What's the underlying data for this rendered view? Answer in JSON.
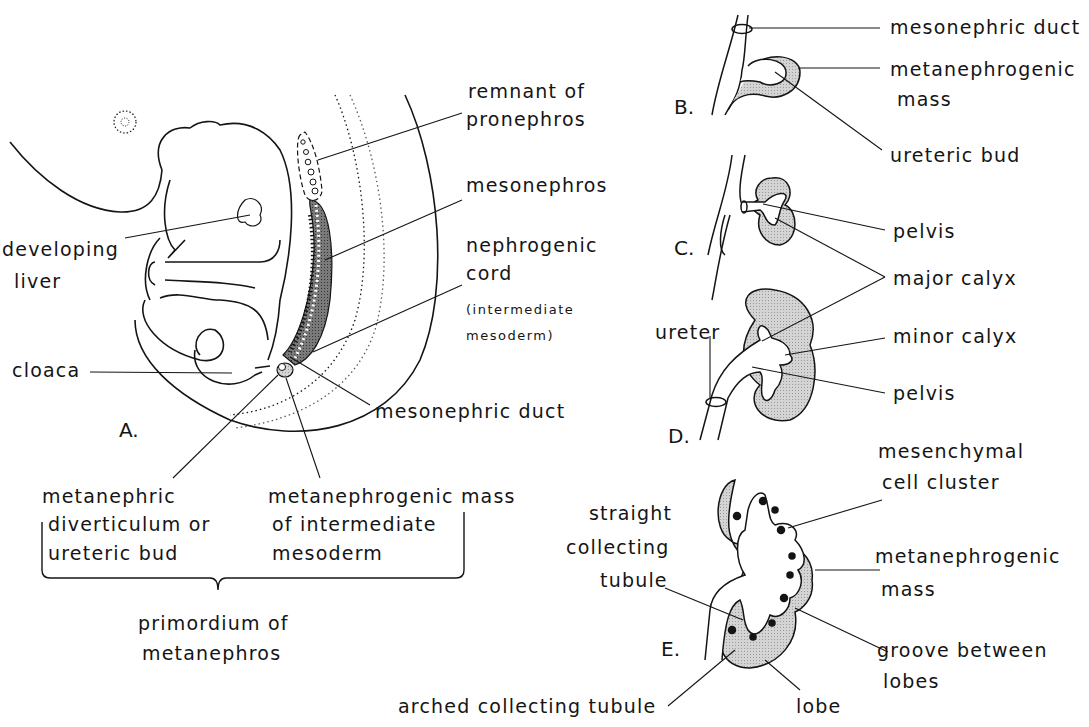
{
  "figure": {
    "colors": {
      "ink": "#141414",
      "stipple": "#c8c8c8",
      "dark_stipple": "#6a6a6a",
      "background": "#ffffff"
    },
    "panels": {
      "A": {
        "letter": "A.",
        "labels": {
          "remnant_pronephros_1": "remnant of",
          "remnant_pronephros_2": "pronephros",
          "mesonephros": "mesonephros",
          "nephrogenic_cord_1": "nephrogenic",
          "nephrogenic_cord_2": "cord",
          "nephrogenic_cord_3": "(intermediate",
          "nephrogenic_cord_4": "mesoderm)",
          "developing_liver_1": "developing",
          "developing_liver_2": "liver",
          "cloaca": "cloaca",
          "mesonephric_duct": "mesonephric duct",
          "metanephric_diverticulum_1": "metanephric",
          "metanephric_diverticulum_2": "diverticulum or",
          "metanephric_diverticulum_3": "ureteric bud",
          "metanephrogenic_mass_1": "metanephrogenic  mass",
          "metanephrogenic_mass_2": "of intermediate",
          "metanephrogenic_mass_3": "mesoderm",
          "primordium_1": "primordium of",
          "primordium_2": "metanephros"
        }
      },
      "B": {
        "letter": "B.",
        "labels": {
          "mesonephric_duct": "mesonephric duct",
          "metanephrogenic_mass_1": "metanephrogenic",
          "metanephrogenic_mass_2": "mass",
          "ureteric_bud": "ureteric bud"
        }
      },
      "C": {
        "letter": "C.",
        "labels": {
          "pelvis": "pelvis",
          "major_calyx": "major calyx"
        }
      },
      "D": {
        "letter": "D.",
        "labels": {
          "ureter": "ureter",
          "minor_calyx": "minor calyx",
          "pelvis": "pelvis"
        }
      },
      "E": {
        "letter": "E.",
        "labels": {
          "mesenchymal_1": "mesenchymal",
          "mesenchymal_2": "cell cluster",
          "straight_1": "straight",
          "straight_2": "collecting",
          "straight_3": "tubule",
          "metanephrogenic_mass_1": "metanephrogenic",
          "metanephrogenic_mass_2": "mass",
          "groove_1": "groove between",
          "groove_2": "lobes",
          "arched": "arched collecting tubule",
          "lobe": "lobe"
        }
      }
    }
  }
}
